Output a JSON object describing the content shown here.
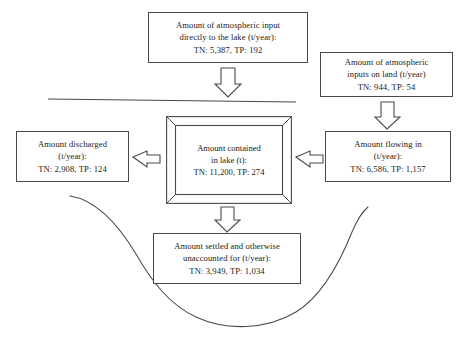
{
  "diagram": {
    "line_color": "#4a4a4a",
    "text_color": "#1a1a1a",
    "background": "#ffffff",
    "nodes": {
      "atmospheric_to_lake": {
        "line1": "Amount of atmospheric input",
        "line2": "directly to the lake (t/year):",
        "line3": "TN: 5,387,    TP: 192"
      },
      "atmospheric_on_land": {
        "line1": "Amount of atmospheric",
        "line2": "inputs on land (t/year)",
        "line3": "TN: 944,    TP: 54"
      },
      "discharged": {
        "line1": "Amount discharged",
        "line2": "(t/year):",
        "line3": "TN: 2,908,    TP: 124"
      },
      "contained_in_lake": {
        "line1": "Amount contained",
        "line2": "in lake (t):",
        "line3": "TN: 11,200,    TP: 274"
      },
      "flowing_in": {
        "line1": "Amount flowing in",
        "line2": "(t/year):",
        "line3": "TN: 6,586,    TP: 1,157"
      },
      "settled": {
        "line1": "Amount settled and otherwise",
        "line2": "unaccounted for (t/year):",
        "line3": "TN: 3,949,    TP: 1,034"
      }
    },
    "arrows": [
      {
        "name": "arrow-atmospheric-to-lake-down",
        "direction": "down"
      },
      {
        "name": "arrow-atmospheric-land-down",
        "direction": "down"
      },
      {
        "name": "arrow-lake-to-discharged-left",
        "direction": "left"
      },
      {
        "name": "arrow-flowing-in-to-lake-left",
        "direction": "left"
      },
      {
        "name": "arrow-lake-to-settled-down",
        "direction": "down"
      }
    ],
    "decorations": [
      {
        "name": "water-surface-line",
        "type": "line"
      },
      {
        "name": "lake-basin-curve",
        "type": "curve"
      }
    ]
  }
}
